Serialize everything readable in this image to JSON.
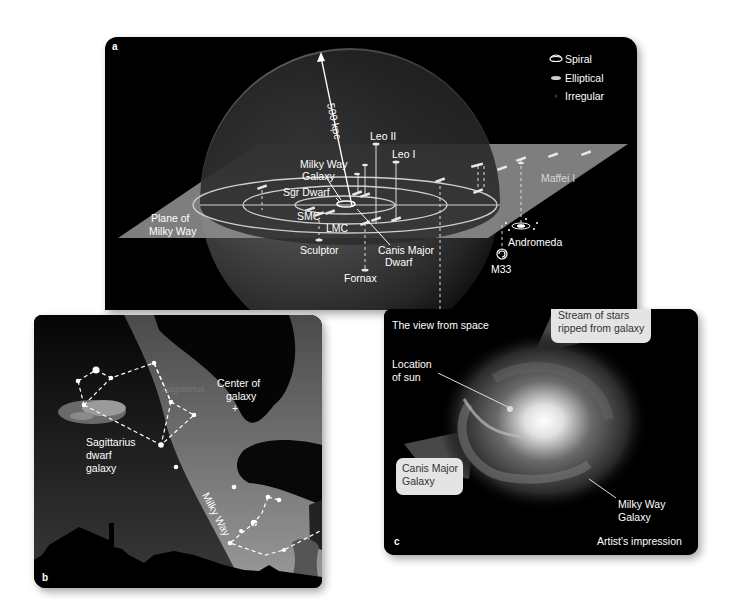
{
  "panel_a": {
    "letter": "a",
    "distance_label": "500 kpc",
    "plane_label_line1": "Plane of",
    "plane_label_line2": "Milky Way",
    "legend": [
      {
        "icon": "spiral-galaxy-icon",
        "label": "Spiral"
      },
      {
        "icon": "elliptical-galaxy-icon",
        "label": "Elliptical"
      },
      {
        "icon": "irregular-galaxy-icon",
        "label": "Irregular"
      }
    ],
    "galaxies": {
      "leo_ii": "Leo II",
      "leo_i": "Leo I",
      "milky_way_line1": "Milky Way",
      "milky_way_line2": "Galaxy",
      "sgr_dwarf": "Sgr Dwarf",
      "smc": "SMC",
      "lmc": "LMC",
      "sculptor": "Sculptor",
      "fornax": "Fornax",
      "canis_major_line1": "Canis Major",
      "canis_major_line2": "Dwarf",
      "maffei": "Maffei I",
      "andromeda": "Andromeda",
      "m33": "M33"
    }
  },
  "panel_b": {
    "letter": "b",
    "center_line1": "Center of",
    "center_line2": "galaxy",
    "center_marker": "+",
    "sagittarius_constellation": "Sagittarius",
    "sgr_line1": "Sagittarius",
    "sgr_line2": "dwarf",
    "sgr_line3": "galaxy",
    "milky_way": "Milky Way",
    "scorpius": "Scorpius"
  },
  "panel_c": {
    "letter": "c",
    "title": "The view from space",
    "stream_line1": "Stream of stars",
    "stream_line2": "ripped from galaxy",
    "sun_line1": "Location",
    "sun_line2": "of sun",
    "canis_line1": "Canis Major",
    "canis_line2": "Galaxy",
    "mw_line1": "Milky Way",
    "mw_line2": "Galaxy",
    "caption": "Artist's impression"
  }
}
